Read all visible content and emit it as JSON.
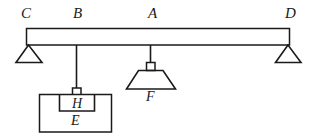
{
  "figure": {
    "type": "physics-lever-diagram",
    "caption": "",
    "stroke_color": "#1a1a1a",
    "background_color": "#ffffff",
    "fill_color": "#ffffff"
  },
  "beam": {
    "name": "horizontal-beam",
    "left_label": "C",
    "right_label": "D",
    "interior_labels": [
      "B",
      "A"
    ]
  },
  "labels": {
    "c": "C",
    "b": "B",
    "a": "A",
    "d": "D",
    "f": "F",
    "h": "H",
    "e": "E"
  },
  "supports": [
    {
      "name": "left-support",
      "at": "C",
      "shape": "triangle"
    },
    {
      "name": "right-support",
      "at": "D",
      "shape": "triangle"
    }
  ],
  "hangers": [
    {
      "name": "hanger-b",
      "from": "B",
      "load": "H",
      "shape": "rod-with-connector"
    },
    {
      "name": "hanger-a",
      "from": "A",
      "load": "F",
      "shape": "rod-with-connector"
    }
  ],
  "loads": [
    {
      "name": "load-f",
      "label": "F",
      "shape": "trapezoid",
      "hangs_from": "A"
    },
    {
      "name": "load-h",
      "label": "H",
      "shape": "rectangle",
      "hangs_from": "B",
      "inside": "E"
    },
    {
      "name": "container-e",
      "label": "E",
      "shape": "rectangle",
      "contains": "H"
    }
  ]
}
